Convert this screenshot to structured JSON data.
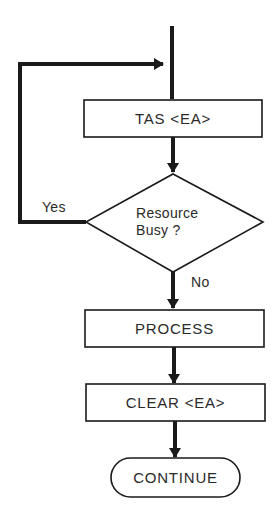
{
  "diagram": {
    "type": "flowchart",
    "colors": {
      "stroke": "#1a1a1a",
      "text": "#2a2a2a",
      "background": "#ffffff"
    },
    "nodes": [
      {
        "id": "tas",
        "shape": "rectangle",
        "label": "TAS <EA>"
      },
      {
        "id": "busy",
        "shape": "diamond",
        "label_line1": "Resource",
        "label_line2": "Busy ?"
      },
      {
        "id": "process",
        "shape": "rectangle",
        "label": "PROCESS"
      },
      {
        "id": "clear",
        "shape": "rectangle",
        "label": "CLEAR <EA>"
      },
      {
        "id": "continue",
        "shape": "terminal",
        "label": "CONTINUE"
      }
    ],
    "edges": [
      {
        "from": "start",
        "to": "tas"
      },
      {
        "from": "tas",
        "to": "busy"
      },
      {
        "from": "busy",
        "to": "tas",
        "label": "Yes"
      },
      {
        "from": "busy",
        "to": "process",
        "label": "No"
      },
      {
        "from": "process",
        "to": "clear"
      },
      {
        "from": "clear",
        "to": "continue"
      }
    ],
    "edge_labels": {
      "yes": "Yes",
      "no": "No"
    }
  }
}
